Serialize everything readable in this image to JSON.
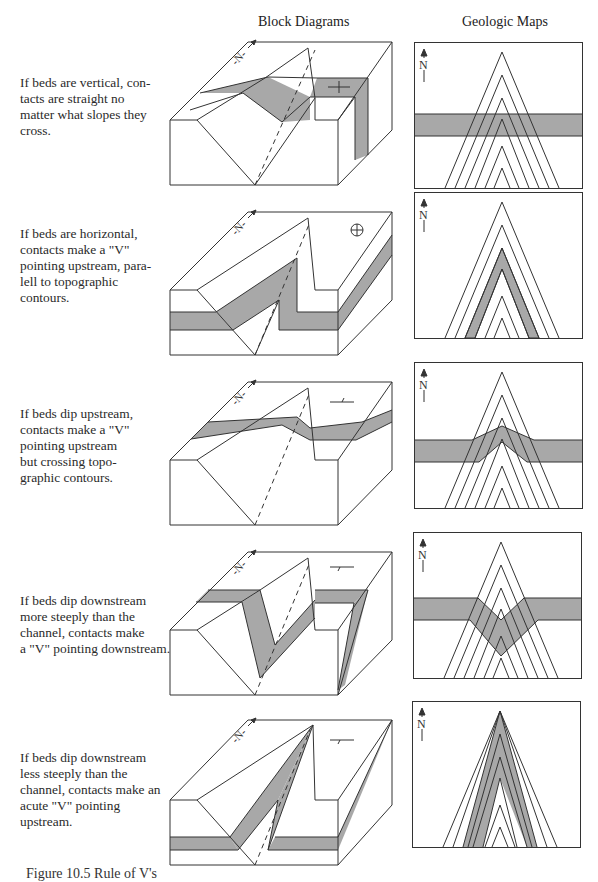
{
  "headers": {
    "block": "Block Diagrams",
    "maps": "Geologic Maps"
  },
  "colors": {
    "bed_fill": "#a8a8a8",
    "line": "#333333",
    "background": "#ffffff"
  },
  "north_label": "N",
  "rows": [
    {
      "id": "vertical",
      "lines": [
        "If beds are vertical, con-",
        "tacts are straight no",
        "matter what slopes they",
        "cross."
      ],
      "symbol": "vertical-bed-symbol"
    },
    {
      "id": "horizontal",
      "lines": [
        "If beds are horizontal,",
        "contacts make a \"V\"",
        "pointing upstream, para-",
        "lell to topographic",
        "contours."
      ],
      "symbol": "horizontal-bed-symbol"
    },
    {
      "id": "dip-upstream",
      "lines": [
        "If beds dip upstream,",
        "contacts make a \"V\"",
        "pointing upstream",
        "but crossing topo-",
        "graphic contours."
      ],
      "symbol": "strike-dip-symbol"
    },
    {
      "id": "dip-downstream-steep",
      "lines": [
        "If beds dip downstream",
        "more steeply than the",
        "channel, contacts make",
        "a \"V\" pointing downstream."
      ],
      "symbol": "strike-dip-symbol"
    },
    {
      "id": "dip-downstream-gentle",
      "lines": [
        "If beds dip downstream",
        "less steeply  than the",
        "channel, contacts make an",
        "acute \"V\" pointing",
        "upstream."
      ],
      "symbol": "strike-dip-symbol"
    }
  ],
  "caption": "Figure 10.5  Rule of V's"
}
